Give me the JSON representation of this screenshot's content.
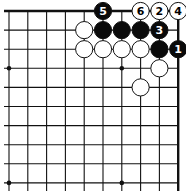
{
  "diagram": {
    "type": "go-board-fragment",
    "columns": 10,
    "rows": 10,
    "origin": {
      "x": 9,
      "y": 11
    },
    "spacing_x": 18.8,
    "spacing_y": 19.1,
    "thick_edges": [
      "top",
      "right"
    ],
    "star_points": [
      [
        0,
        3
      ],
      [
        6,
        3
      ],
      [
        0,
        9
      ],
      [
        6,
        9
      ]
    ],
    "colors": {
      "line": "#111111",
      "black": "#0a0a0a",
      "white": "#ffffff",
      "background": "#ffffff"
    },
    "stones": [
      {
        "color": "black",
        "col": 5,
        "row": 0,
        "label": "5"
      },
      {
        "color": "white",
        "col": 7,
        "row": 0,
        "label": "6"
      },
      {
        "color": "white",
        "col": 8,
        "row": 0,
        "label": "2"
      },
      {
        "color": "white",
        "col": 9,
        "row": 0,
        "label": "4"
      },
      {
        "color": "white",
        "col": 4,
        "row": 1,
        "label": ""
      },
      {
        "color": "black",
        "col": 5,
        "row": 1,
        "label": ""
      },
      {
        "color": "black",
        "col": 6,
        "row": 1,
        "label": ""
      },
      {
        "color": "black",
        "col": 7,
        "row": 1,
        "label": ""
      },
      {
        "color": "black",
        "col": 8,
        "row": 1,
        "label": "3"
      },
      {
        "color": "white",
        "col": 4,
        "row": 2,
        "label": ""
      },
      {
        "color": "white",
        "col": 5,
        "row": 2,
        "label": ""
      },
      {
        "color": "white",
        "col": 6,
        "row": 2,
        "label": ""
      },
      {
        "color": "white",
        "col": 7,
        "row": 2,
        "label": ""
      },
      {
        "color": "black",
        "col": 8,
        "row": 2,
        "label": ""
      },
      {
        "color": "black",
        "col": 9,
        "row": 2,
        "label": "1"
      },
      {
        "color": "white",
        "col": 8,
        "row": 3,
        "label": ""
      },
      {
        "color": "white",
        "col": 7,
        "row": 4,
        "label": ""
      }
    ]
  }
}
